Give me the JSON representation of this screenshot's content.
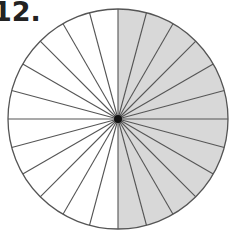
{
  "problem": {
    "number_label": "12."
  },
  "figure": {
    "type": "fraction-circle",
    "total_parts": 24,
    "shaded_parts": 12,
    "shaded_side": "right",
    "shade_color": "#d8d8d8",
    "line_color": "#555555",
    "center_dot_color": "#111111",
    "center": [
      118,
      119
    ],
    "radius": 110
  }
}
